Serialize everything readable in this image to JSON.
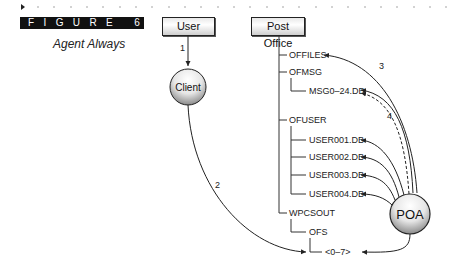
{
  "figure": {
    "label": "FIGURE 6.9",
    "caption": "Agent Always"
  },
  "nodes": {
    "user": "User",
    "post_office": "Post Office",
    "client": "Client",
    "poa": "POA"
  },
  "tree": {
    "offiles": "OFFILES",
    "ofmsg": "OFMSG",
    "msg_db": "MSG0–24.DB",
    "ofuser": "OFUSER",
    "user001": "USER001.DB",
    "user002": "USER002.DB",
    "user003": "USER003.DB",
    "user004": "USER004.DB",
    "wpcsout": "WPCSOUT",
    "ofs": "OFS",
    "queue": "<0–7>"
  },
  "steps": {
    "s1": "1",
    "s2": "2",
    "s3": "3",
    "s4": "4"
  }
}
